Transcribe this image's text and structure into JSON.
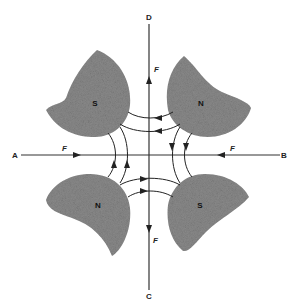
{
  "diagram": {
    "type": "four-pole magnetic field (quadrupole) force diagram",
    "axis_labels": {
      "left": "A",
      "right": "B",
      "top": "D",
      "bottom": "C"
    },
    "force_label": "F",
    "forces": [
      {
        "id": "force-top",
        "label": "F",
        "direction": "up",
        "position": "vertical axis, upper"
      },
      {
        "id": "force-bottom",
        "label": "F",
        "direction": "down",
        "position": "vertical axis, lower"
      },
      {
        "id": "force-left",
        "label": "F",
        "direction": "right",
        "position": "horizontal axis, left"
      },
      {
        "id": "force-right",
        "label": "F",
        "direction": "left",
        "position": "horizontal axis, right"
      }
    ],
    "poles": [
      {
        "id": "pole-top-left",
        "label": "S"
      },
      {
        "id": "pole-top-right",
        "label": "N"
      },
      {
        "id": "pole-bottom-left",
        "label": "N"
      },
      {
        "id": "pole-bottom-right",
        "label": "S"
      }
    ],
    "field_lines": {
      "top": "N (top-right) to S (top-left), arrows pointing left",
      "bottom": "N (bottom-left) to S (bottom-right), arrows pointing right",
      "left": "N (bottom-left) to S (top-left), arrows pointing up",
      "right": "N (top-right) to S (bottom-right), arrows pointing down"
    },
    "colors": {
      "pole_fill": "#8a8a8a",
      "line": "#222222",
      "background": "#ffffff"
    }
  }
}
